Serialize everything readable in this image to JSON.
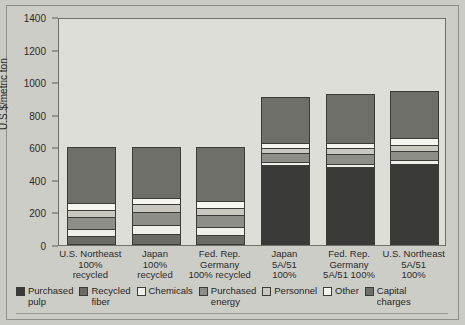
{
  "chart_data": {
    "type": "bar",
    "subtype": "stacked",
    "title": "",
    "xlabel": "",
    "ylabel": "U.S.$/metric ton",
    "ylim": [
      0,
      1400
    ],
    "yticks": [
      0,
      200,
      400,
      600,
      800,
      1000,
      1200,
      1400
    ],
    "grid": false,
    "legend_position": "bottom",
    "categories": [
      "U.S. Northeast\n100%\nrecycled",
      "Japan\n100%\nrecycled",
      "Fed. Rep.\nGermany\n100% recycled",
      "Japan\n5A/51\n100%",
      "Fed. Rep.\nGermany\n5A/51 100%",
      "U.S. Northeast\n5A/51\n100%"
    ],
    "series": [
      {
        "name": "Purchased pulp",
        "color": "#3a3a38",
        "values": [
          0,
          0,
          0,
          490,
          480,
          500
        ]
      },
      {
        "name": "Recycled fiber",
        "color": "#6b6b66",
        "values": [
          55,
          70,
          60,
          0,
          0,
          0
        ]
      },
      {
        "name": "Chemicals",
        "color": "#f0f0ea",
        "values": [
          45,
          55,
          50,
          20,
          20,
          20
        ]
      },
      {
        "name": "Purchased energy",
        "color": "#8e8e88",
        "values": [
          70,
          75,
          75,
          55,
          60,
          60
        ]
      },
      {
        "name": "Personnel",
        "color": "#c8c8c1",
        "values": [
          45,
          50,
          45,
          30,
          35,
          35
        ]
      },
      {
        "name": "Other",
        "color": "#f6f6f1",
        "values": [
          45,
          40,
          40,
          30,
          30,
          40
        ]
      },
      {
        "name": "Capital charges",
        "color": "#6f6f6a",
        "values": [
          340,
          310,
          330,
          285,
          305,
          290
        ]
      }
    ],
    "totals": [
      600,
      600,
      600,
      910,
      930,
      945
    ]
  },
  "legend": {
    "items": [
      {
        "label": "Purchased\npulp",
        "color": "#3a3a38"
      },
      {
        "label": "Recycled\nfiber",
        "color": "#6b6b66"
      },
      {
        "label": "Chemicals",
        "color": "#f0f0ea"
      },
      {
        "label": "Purchased\nenergy",
        "color": "#8e8e88"
      },
      {
        "label": "Personnel",
        "color": "#c8c8c1"
      },
      {
        "label": "Other",
        "color": "#f6f6f1"
      },
      {
        "label": "Capital\ncharges",
        "color": "#6f6f6a"
      }
    ]
  },
  "colors": {
    "page_background": "#cbcbc6",
    "plot_background": "#dedeD9",
    "axis": "#5d5d59",
    "text": "#2a2a28"
  }
}
